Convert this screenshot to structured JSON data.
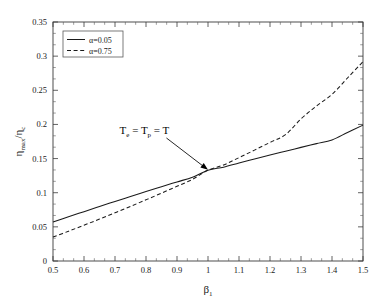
{
  "chart_data": {
    "type": "line",
    "title": "",
    "xlabel": "β₁",
    "ylabel": "ηmax/ηc",
    "xlim": [
      0.5,
      1.5
    ],
    "ylim": [
      0,
      0.35
    ],
    "xticks": [
      "0.5",
      "0.6",
      "0.7",
      "0.8",
      "0.9",
      "1",
      "1.1",
      "1.2",
      "1.3",
      "1.4",
      "1.5"
    ],
    "yticks": [
      "0",
      "0.05",
      "0.1",
      "0.15",
      "0.2",
      "0.25",
      "0.3",
      "0.35"
    ],
    "xtick_values": [
      0.5,
      0.6,
      0.7,
      0.8,
      0.9,
      1.0,
      1.1,
      1.2,
      1.3,
      1.4,
      1.5
    ],
    "ytick_values": [
      0,
      0.05,
      0.1,
      0.15,
      0.2,
      0.25,
      0.3,
      0.35
    ],
    "minor_ticks_per_interval": 2,
    "grid": false,
    "legend_position": "upper-left",
    "x": [
      0.5,
      0.55,
      0.6,
      0.65,
      0.7,
      0.75,
      0.8,
      0.85,
      0.9,
      0.95,
      1.0,
      1.05,
      1.1,
      1.15,
      1.2,
      1.25,
      1.3,
      1.35,
      1.4,
      1.45,
      1.5
    ],
    "series": [
      {
        "name": "α=0.05",
        "style": "solid",
        "color": "#1a1a1a",
        "values": [
          0.057,
          0.0647,
          0.0723,
          0.0798,
          0.0872,
          0.0945,
          0.1017,
          0.1088,
          0.1158,
          0.1227,
          0.133,
          0.1374,
          0.1434,
          0.1493,
          0.1551,
          0.1608,
          0.1664,
          0.1719,
          0.1773,
          0.1882,
          0.199
        ]
      },
      {
        "name": "α=0.75",
        "style": "dashed",
        "color": "#1a1a1a",
        "values": [
          0.035,
          0.0436,
          0.0524,
          0.0614,
          0.0706,
          0.08,
          0.0896,
          0.0994,
          0.1094,
          0.1196,
          0.133,
          0.1406,
          0.1514,
          0.1624,
          0.1736,
          0.185,
          0.208,
          0.227,
          0.244,
          0.268,
          0.292
        ]
      }
    ],
    "annotations": [
      {
        "text": "Te = Tp = T",
        "text_parts": [
          "T",
          "e",
          " = T",
          "p",
          " = T"
        ],
        "x_text": 0.795,
        "y_text": 0.186,
        "x_point": 1.0,
        "y_point": 0.1335,
        "arrow": true
      }
    ]
  },
  "legend": {
    "entries": [
      {
        "label": "α=0.05",
        "style": "solid"
      },
      {
        "label": "α=0.75",
        "style": "dashed"
      }
    ]
  },
  "axis_titles": {
    "x": "β",
    "x_sub": "1",
    "y_main": "η",
    "y_sub1": "max",
    "y_mid": "/η",
    "y_sub2": "c"
  }
}
